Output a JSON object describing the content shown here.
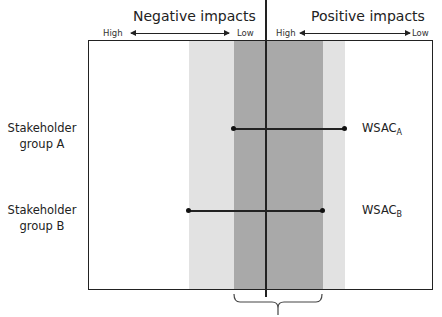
{
  "header": {
    "negative_title": "Negative impacts",
    "positive_title": "Positive impacts",
    "negative_high": "High",
    "negative_low": "Low",
    "positive_high": "High",
    "positive_low": "Low"
  },
  "rows": [
    {
      "label_line1": "Stakeholder",
      "label_line2": "group A",
      "wsac_main": "WSAC",
      "wsac_sub": "A"
    },
    {
      "label_line1": "Stakeholder",
      "label_line2": "group B",
      "wsac_main": "WSAC",
      "wsac_sub": "B"
    }
  ],
  "colors": {
    "light_band": "#e2e2e2",
    "dark_band": "#a9a9a9",
    "line": "#222222"
  }
}
